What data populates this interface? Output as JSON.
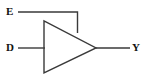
{
  "diagram": {
    "type": "logic-gate-schematic",
    "symbol": "buffer-triangle",
    "background_color": "#ffffff",
    "line_color": "#3a3a3a",
    "label_color": "#111111",
    "labels": {
      "enable": "E",
      "data": "D",
      "output": "Y"
    },
    "geometry": {
      "triangle_left_x": 44,
      "triangle_top_y": 21,
      "triangle_bottom_y": 73,
      "triangle_apex_x": 96,
      "triangle_apex_y": 48,
      "enable_line_y": 12,
      "enable_line_start_x": 18,
      "enable_line_corner_x": 77,
      "enable_line_end_y": 33,
      "data_line_y": 48,
      "data_line_start_x": 18,
      "data_line_end_x": 45,
      "output_line_y": 48,
      "output_line_start_x": 96,
      "output_line_end_x": 130
    }
  }
}
